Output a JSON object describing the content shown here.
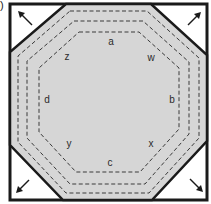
{
  "panel_label": "b)",
  "colors": {
    "octagon_fill": "#d6d6d6",
    "frame": "#1a1a1a",
    "dash": "#3a3a3a",
    "corner_fill": "#ffffff"
  },
  "corner_arrows": [
    {
      "id": "top-left",
      "direction": "up-left"
    },
    {
      "id": "top-right",
      "direction": "up-right"
    },
    {
      "id": "bottom-left",
      "direction": "down-left"
    },
    {
      "id": "bottom-right",
      "direction": "down-right"
    }
  ],
  "labels": {
    "a": "a",
    "w": "w",
    "b": "b",
    "x": "x",
    "c": "c",
    "y": "y",
    "d": "d",
    "z": "z"
  },
  "dashed_outlines_count": 3
}
